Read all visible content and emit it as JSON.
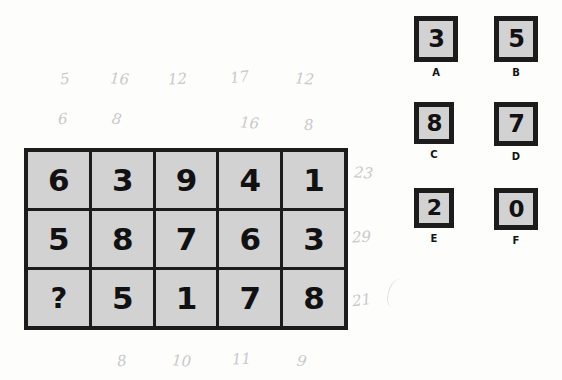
{
  "colors": {
    "cell_fill": "#d2d2d2",
    "border": "#1c1c1c",
    "digit": "#111111",
    "pencil": "#c9c9c9",
    "page": "#fdfdfc"
  },
  "puzzle": {
    "grid": {
      "rows": 3,
      "columns": 5,
      "cells": [
        [
          "6",
          "3",
          "9",
          "4",
          "1"
        ],
        [
          "5",
          "8",
          "7",
          "6",
          "3"
        ],
        [
          "?",
          "5",
          "1",
          "7",
          "8"
        ]
      ],
      "missing_cell": {
        "row": 3,
        "column": 1,
        "symbol": "?"
      }
    }
  },
  "annotations": {
    "top_row_1": [
      "5",
      "16",
      "12",
      "17",
      "12"
    ],
    "top_row_2": [
      "6",
      "8",
      "",
      "16",
      "8"
    ],
    "right_column": [
      "23",
      "29",
      "21"
    ],
    "bottom_row": [
      "8",
      "10",
      "11",
      "9"
    ],
    "stroke_mark": "pencil-stroke"
  },
  "options": [
    {
      "label": "A",
      "value": "3"
    },
    {
      "label": "B",
      "value": "5"
    },
    {
      "label": "C",
      "value": "8"
    },
    {
      "label": "D",
      "value": "7"
    },
    {
      "label": "E",
      "value": "2"
    },
    {
      "label": "F",
      "value": "0"
    }
  ]
}
